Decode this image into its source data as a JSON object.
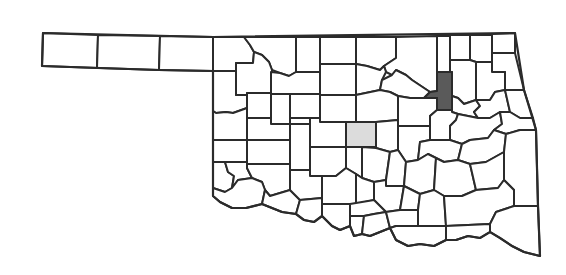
{
  "map": {
    "region": "Oklahoma",
    "subdivision": "counties",
    "colors": {
      "background": "#ffffff",
      "border": "#2b2b2b",
      "county_fill": "#ffffff",
      "highlight_dark": "#5a5a5a",
      "highlight_light": "#dcdcdc"
    },
    "highlighted_counties": [
      {
        "shade": "dark",
        "position": "north-east central, vertical strip"
      },
      {
        "shade": "light",
        "position": "central"
      }
    ]
  }
}
